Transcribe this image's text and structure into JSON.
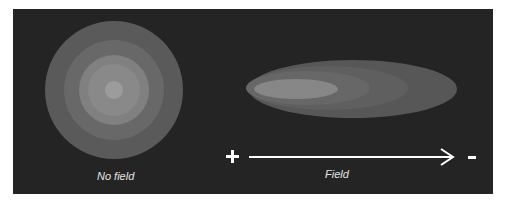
{
  "diagram": {
    "left": {
      "caption": "No field",
      "rings": [
        {
          "r": 69,
          "color": "#5a5a5a"
        },
        {
          "r": 50,
          "color": "#686868"
        },
        {
          "r": 35,
          "color": "#808080"
        },
        {
          "r": 26,
          "color": "#8a8a8a"
        },
        {
          "r": 9,
          "color": "#9c9c9c"
        }
      ]
    },
    "right": {
      "caption": "Field",
      "plus_sign": "+",
      "minus_sign": "-",
      "arrow_direction": "right",
      "ellipses": [
        {
          "rx": 104,
          "ry": 29,
          "color": "#575757"
        },
        {
          "rx": 80,
          "ry": 22,
          "color": "#5f5f5f"
        },
        {
          "rx": 60,
          "ry": 17,
          "color": "#676767"
        },
        {
          "rx": 42,
          "ry": 10,
          "color": "#868686"
        }
      ]
    },
    "colors": {
      "background": "#242424",
      "foreground": "#ffffff"
    }
  }
}
